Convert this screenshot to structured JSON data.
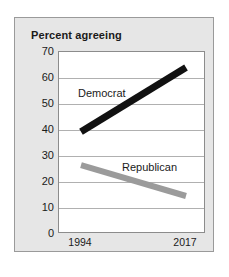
{
  "chart_data": {
    "type": "line",
    "title": "Percent agreeing",
    "xlabel": "",
    "ylabel": "",
    "x": [
      "1994",
      "2017"
    ],
    "categories": [
      "1994",
      "2017"
    ],
    "series": [
      {
        "name": "Democrat",
        "values": [
          39,
          64
        ],
        "color": "#111111"
      },
      {
        "name": "Republican",
        "values": [
          26,
          14
        ],
        "color": "#9b9b9b"
      }
    ],
    "ylim": [
      0,
      70
    ],
    "yticks": [
      0,
      10,
      20,
      30,
      40,
      50,
      60,
      70
    ],
    "ytick_labels": [
      "0",
      "10",
      "20",
      "30",
      "40",
      "50",
      "60",
      "70"
    ],
    "grid": true,
    "legend": "inline-annotations",
    "annotations": [
      {
        "text": "Democrat",
        "series": "Democrat"
      },
      {
        "text": "Republican",
        "series": "Republican"
      }
    ]
  },
  "figure": {
    "title": "Percent agreeing",
    "panel_background": "#e6e6e6",
    "plot_background": "#ffffff",
    "gridline_color": "#b0b0b0",
    "frame_color": "#8c8c8c"
  },
  "axis": {
    "y_ticks": [
      "70",
      "60",
      "50",
      "40",
      "30",
      "20",
      "10",
      "0"
    ],
    "x_ticks": [
      "1994",
      "2017"
    ]
  },
  "labels": {
    "democrat": "Democrat",
    "republican": "Republican"
  }
}
